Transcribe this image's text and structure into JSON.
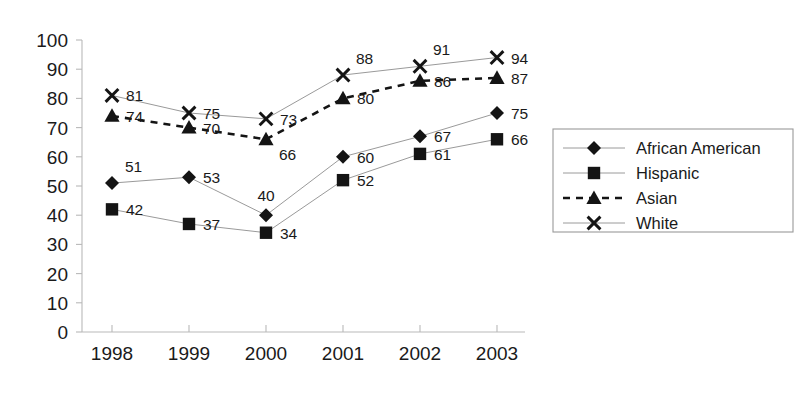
{
  "chart_data": {
    "type": "line",
    "title": "",
    "subtitle": "",
    "xlabel": "",
    "ylabel": "",
    "categories": [
      "1998",
      "1999",
      "2000",
      "2001",
      "2002",
      "2003"
    ],
    "x": [
      1998,
      1999,
      2000,
      2001,
      2002,
      2003
    ],
    "ylim": [
      0,
      100
    ],
    "yticks": [
      0,
      10,
      20,
      30,
      40,
      50,
      60,
      70,
      80,
      90,
      100
    ],
    "ytick_labels": [
      "0",
      "10",
      "20",
      "30",
      "40",
      "50",
      "60",
      "70",
      "80",
      "90",
      "100"
    ],
    "grid": false,
    "legend_position": "right",
    "data_labels": true,
    "series": [
      {
        "name": "African American",
        "marker": "diamond",
        "line_style": "solid",
        "values": [
          51,
          53,
          40,
          60,
          67,
          75
        ],
        "labels": [
          "51",
          "53",
          "40",
          "60",
          "67",
          "75"
        ],
        "label_placement": [
          "above-right",
          "right",
          "above-center",
          "right",
          "right",
          "right"
        ]
      },
      {
        "name": "Hispanic",
        "marker": "square",
        "line_style": "solid",
        "values": [
          42,
          37,
          34,
          52,
          61,
          66
        ],
        "labels": [
          "42",
          "37",
          "34",
          "52",
          "61",
          "66"
        ],
        "label_placement": [
          "right",
          "right",
          "right",
          "right",
          "right",
          "right"
        ]
      },
      {
        "name": "Asian",
        "marker": "triangle",
        "line_style": "dashed",
        "values": [
          74,
          70,
          66,
          80,
          86,
          87
        ],
        "labels": [
          "74",
          "70",
          "66",
          "80",
          "86",
          "87"
        ],
        "label_placement": [
          "right",
          "right",
          "below-right",
          "right",
          "right",
          "right"
        ]
      },
      {
        "name": "White",
        "marker": "x",
        "line_style": "solid",
        "values": [
          81,
          75,
          73,
          88,
          91,
          94
        ],
        "labels": [
          "81",
          "75",
          "73",
          "88",
          "91",
          "94"
        ],
        "label_placement": [
          "right",
          "right",
          "right",
          "above-right",
          "above-right",
          "right"
        ]
      }
    ],
    "colors": {
      "series_marker": "#141414",
      "series_line": "#9a9a9a",
      "dashed_line": "#141414",
      "axis": "#b9b9b9",
      "text": "#1a1a1a",
      "background": "#ffffff"
    }
  },
  "legend": {
    "entries": [
      {
        "label": "African American",
        "marker": "diamond",
        "line_style": "solid"
      },
      {
        "label": "Hispanic",
        "marker": "square",
        "line_style": "solid"
      },
      {
        "label": "Asian",
        "marker": "triangle",
        "line_style": "dashed"
      },
      {
        "label": "White",
        "marker": "x",
        "line_style": "solid"
      }
    ]
  }
}
